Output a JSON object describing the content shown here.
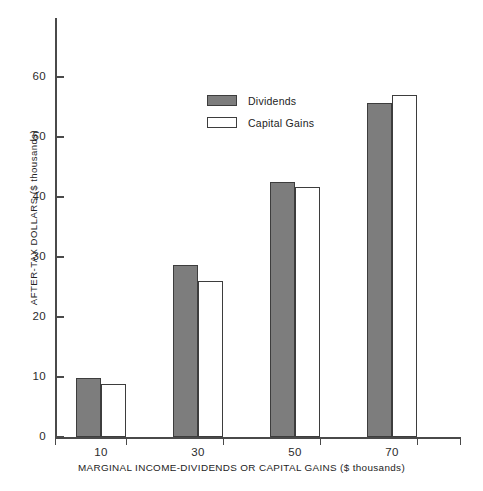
{
  "chart_data": {
    "type": "bar",
    "title": "",
    "xlabel": "MARGINAL INCOME-DIVIDENDS OR CAPITAL GAINS ($ thousands)",
    "ylabel": "AFTER-TAX DOLLARS ($ thousands)",
    "categories": [
      "10",
      "30",
      "50",
      "70"
    ],
    "series": [
      {
        "name": "Dividends",
        "values": [
          9.8,
          28.6,
          42.5,
          55.6
        ],
        "color": "#7d7d7d"
      },
      {
        "name": "Capital Gains",
        "values": [
          8.9,
          26.0,
          41.6,
          57.0
        ],
        "color": "#ffffff"
      }
    ],
    "ylim": [
      0,
      68
    ],
    "yticks": [
      0,
      10,
      20,
      30,
      40,
      50,
      60
    ],
    "ytick_labels": [
      "0",
      "10",
      "20",
      "30",
      "40",
      "50",
      "60"
    ],
    "xtick_labels": [
      "10",
      "30",
      "50",
      "70"
    ],
    "grid": false,
    "legend_position": "upper-center",
    "legend": [
      "Dividends",
      "Capital Gains"
    ]
  },
  "legend": {
    "entries": [
      {
        "label": "Dividends",
        "swatch": "filled-gray-swatch"
      },
      {
        "label": "Capital Gains",
        "swatch": "outlined-white-swatch"
      }
    ]
  },
  "axes": {
    "y_title": "AFTER-TAX DOLLARS ($ thousands)",
    "x_title": "MARGINAL INCOME-DIVIDENDS OR CAPITAL GAINS ($ thousands)",
    "y_ticks": [
      "0",
      "10",
      "20",
      "30",
      "40",
      "50",
      "60"
    ],
    "x_ticks": [
      "10",
      "30",
      "50",
      "70"
    ]
  }
}
